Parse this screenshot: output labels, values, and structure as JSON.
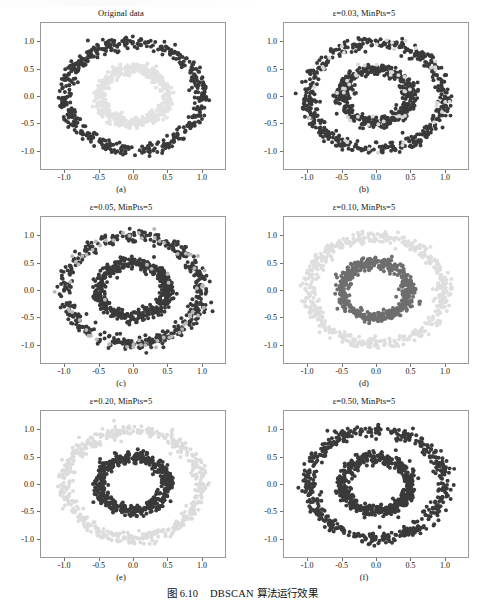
{
  "figure": {
    "caption_label": "图 6.10",
    "caption_text": "DBSCAN 算法运行效果",
    "caption_full": "图 6.10    DBSCAN 算法运行效果"
  },
  "axis": {
    "yticks": [
      "1.0",
      "0.5",
      "0.0",
      "-0.5",
      "-1.0"
    ],
    "ytick_values": [
      1.0,
      0.5,
      0.0,
      -0.5,
      -1.0
    ],
    "xticks": [
      "-1.0",
      "-0.5",
      "0.0",
      "0.5",
      "1.0"
    ],
    "xtick_values": [
      -1.0,
      -0.5,
      0.0,
      0.5,
      1.0
    ],
    "xlim": [
      -1.35,
      1.35
    ],
    "ylim": [
      -1.35,
      1.35
    ]
  },
  "colors": {
    "cluster_dark": "#3a3a3a",
    "cluster_mid": "#6e6e6e",
    "cluster_light": "#d8d8d8",
    "cluster_pale": "#e6e6e6",
    "axes_frame": "#9a9a9a",
    "text": "#111111",
    "background": "#ffffff"
  },
  "panels": [
    {
      "id": "a",
      "title": "Original data",
      "title_is_epsilon": false,
      "sublabel": "(a)"
    },
    {
      "id": "b",
      "title": "ε=0.03, MinPts=5",
      "title_is_epsilon": true,
      "epsilon": "0.03",
      "minpts": "5",
      "sublabel": "(b)"
    },
    {
      "id": "c",
      "title": "ε=0.05, MinPts=5",
      "title_is_epsilon": true,
      "epsilon": "0.05",
      "minpts": "5",
      "sublabel": "(c)"
    },
    {
      "id": "d",
      "title": "ε=0.10, MinPts=5",
      "title_is_epsilon": true,
      "epsilon": "0.10",
      "minpts": "5",
      "sublabel": "(d)"
    },
    {
      "id": "e",
      "title": "ε=0.20, MinPts=5",
      "title_is_epsilon": true,
      "epsilon": "0.20",
      "minpts": "5",
      "sublabel": "(e)"
    },
    {
      "id": "f",
      "title": "ε=0.50, MinPts=5",
      "title_is_epsilon": true,
      "epsilon": "0.50",
      "minpts": "5",
      "sublabel": "(f)"
    }
  ],
  "chart_data": [
    {
      "type": "scatter",
      "panel": "a",
      "title": "Original data",
      "xlabel": "",
      "ylabel": "",
      "xlim": [
        -1.35,
        1.35
      ],
      "ylim": [
        -1.35,
        1.35
      ],
      "grid": false,
      "legend": "none",
      "series": [
        {
          "name": "outer circle",
          "color": "#3a3a3a",
          "n_points": 500,
          "ring_radius": 1.0,
          "ring_noise": 0.06,
          "marker_size": 2.0
        },
        {
          "name": "inner circle",
          "color": "#e2e2e2",
          "n_points": 500,
          "ring_radius": 0.5,
          "ring_noise": 0.055,
          "marker_size": 2.0
        }
      ]
    },
    {
      "type": "scatter",
      "panel": "b",
      "title": "ε=0.03, MinPts=5",
      "xlim": [
        -1.35,
        1.35
      ],
      "ylim": [
        -1.35,
        1.35
      ],
      "grid": false,
      "legend": "none",
      "series": [
        {
          "name": "cluster-dark-outer",
          "color": "#3a3a3a",
          "n_points": 470,
          "ring_radius": 1.0,
          "ring_noise": 0.06,
          "marker_size": 2.0
        },
        {
          "name": "noise-outer",
          "color": "#d8d8d8",
          "n_points": 30,
          "ring_radius": 1.0,
          "ring_noise": 0.06,
          "marker_size": 2.0
        },
        {
          "name": "cluster-dark-inner",
          "color": "#3a3a3a",
          "n_points": 470,
          "ring_radius": 0.5,
          "ring_noise": 0.055,
          "marker_size": 2.0
        },
        {
          "name": "noise-inner",
          "color": "#d8d8d8",
          "n_points": 30,
          "ring_radius": 0.5,
          "ring_noise": 0.055,
          "marker_size": 2.0
        }
      ]
    },
    {
      "type": "scatter",
      "panel": "c",
      "title": "ε=0.05, MinPts=5",
      "xlim": [
        -1.35,
        1.35
      ],
      "ylim": [
        -1.35,
        1.35
      ],
      "grid": false,
      "legend": "none",
      "series": [
        {
          "name": "cluster-dark-outer",
          "color": "#3a3a3a",
          "n_points": 440,
          "ring_radius": 1.0,
          "ring_noise": 0.06,
          "marker_size": 2.0
        },
        {
          "name": "noise-outer",
          "color": "#b8b8b8",
          "n_points": 60,
          "ring_radius": 1.0,
          "ring_noise": 0.06,
          "marker_size": 2.0
        },
        {
          "name": "cluster-dark-inner",
          "color": "#3a3a3a",
          "n_points": 495,
          "ring_radius": 0.5,
          "ring_noise": 0.055,
          "marker_size": 2.0
        },
        {
          "name": "noise-inner",
          "color": "#b8b8b8",
          "n_points": 5,
          "ring_radius": 0.5,
          "ring_noise": 0.055,
          "marker_size": 2.0
        }
      ]
    },
    {
      "type": "scatter",
      "panel": "d",
      "title": "ε=0.10, MinPts=5",
      "xlim": [
        -1.35,
        1.35
      ],
      "ylim": [
        -1.35,
        1.35
      ],
      "grid": false,
      "legend": "none",
      "series": [
        {
          "name": "cluster-1-outer",
          "color": "#dedede",
          "n_points": 500,
          "ring_radius": 1.0,
          "ring_noise": 0.06,
          "marker_size": 2.0
        },
        {
          "name": "cluster-2-inner",
          "color": "#6e6e6e",
          "n_points": 500,
          "ring_radius": 0.5,
          "ring_noise": 0.055,
          "marker_size": 2.0
        }
      ]
    },
    {
      "type": "scatter",
      "panel": "e",
      "title": "ε=0.20, MinPts=5",
      "xlim": [
        -1.35,
        1.35
      ],
      "ylim": [
        -1.35,
        1.35
      ],
      "grid": false,
      "legend": "none",
      "series": [
        {
          "name": "cluster-1-outer",
          "color": "#dcdcdc",
          "n_points": 500,
          "ring_radius": 1.0,
          "ring_noise": 0.06,
          "marker_size": 2.0
        },
        {
          "name": "cluster-2-inner",
          "color": "#3a3a3a",
          "n_points": 500,
          "ring_radius": 0.5,
          "ring_noise": 0.055,
          "marker_size": 2.0
        }
      ]
    },
    {
      "type": "scatter",
      "panel": "f",
      "title": "ε=0.50, MinPts=5",
      "xlim": [
        -1.35,
        1.35
      ],
      "ylim": [
        -1.35,
        1.35
      ],
      "grid": false,
      "legend": "none",
      "series": [
        {
          "name": "cluster-single-outer",
          "color": "#3a3a3a",
          "n_points": 500,
          "ring_radius": 1.0,
          "ring_noise": 0.06,
          "marker_size": 2.0
        },
        {
          "name": "cluster-single-inner",
          "color": "#3a3a3a",
          "n_points": 500,
          "ring_radius": 0.5,
          "ring_noise": 0.055,
          "marker_size": 2.0
        }
      ]
    }
  ]
}
